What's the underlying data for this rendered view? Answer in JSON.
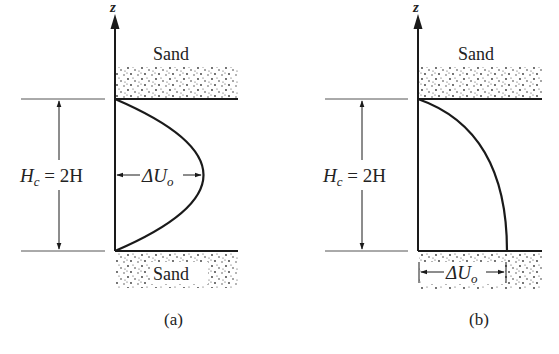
{
  "panels": [
    {
      "id": "a",
      "caption": "(a)",
      "axis_label": "z",
      "top_layer_label": "Sand",
      "bottom_layer_label": "Sand",
      "thickness_label": {
        "H": "H",
        "sub": "c",
        "rest": " = 2H"
      },
      "delta_label": {
        "main": "ΔU",
        "sub": "o"
      },
      "profile": "parabolic (two-way drainage, maximum at mid-depth)"
    },
    {
      "id": "b",
      "caption": "(b)",
      "axis_label": "z",
      "top_layer_label": "Sand",
      "thickness_label": {
        "H": "H",
        "sub": "c",
        "rest": " = 2H"
      },
      "delta_label": {
        "main": "ΔU",
        "sub": "o"
      },
      "profile": "half-parabolic (one-way drainage, maximum at base)"
    }
  ],
  "colors": {
    "line": "#1a1a1a",
    "thin_line": "#555555",
    "sand_dots": "#333333",
    "text": "#222222"
  }
}
